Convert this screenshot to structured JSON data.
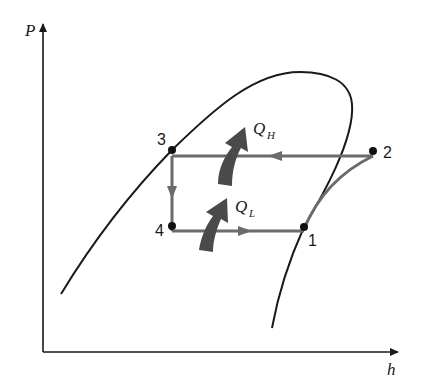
{
  "diagram": {
    "type": "P-h diagram (vapor-compression refrigeration cycle)",
    "axes": {
      "y_label": "P",
      "x_label": "h"
    },
    "states": [
      {
        "id": "1",
        "label": "1",
        "x": 304,
        "y": 227
      },
      {
        "id": "2",
        "label": "2",
        "x": 373,
        "y": 151
      },
      {
        "id": "3",
        "label": "3",
        "x": 172,
        "y": 150
      },
      {
        "id": "4",
        "label": "4",
        "x": 172,
        "y": 226
      }
    ],
    "heat_labels": {
      "high": {
        "main": "Q",
        "sub": "H"
      },
      "low": {
        "main": "Q",
        "sub": "L"
      }
    },
    "colors": {
      "axis": "#1a1a1a",
      "dome": "#1a1a1a",
      "cycle": "#6b6b6b",
      "heat_arrow": "#4a4a4a",
      "point": "#111111"
    }
  }
}
